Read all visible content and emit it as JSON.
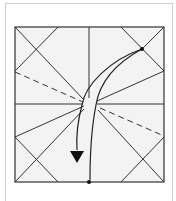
{
  "diagram": {
    "type": "origami-crease-pattern-step",
    "colors": {
      "paper": "#f3f3f3",
      "line": "#333333",
      "frame_border": "#cfcfcf",
      "background": "#ffffff"
    },
    "elements": {
      "square": {
        "x1": 15,
        "y1": 27,
        "x2": 164,
        "y2": 182
      },
      "center": {
        "x": 89,
        "y": 104
      },
      "marked_points": [
        {
          "name": "upper-right-point",
          "x": 142,
          "y": 49
        },
        {
          "name": "bottom-center-point",
          "x": 89,
          "y": 182
        }
      ],
      "dashed_lines": 2,
      "arrow": {
        "from": "upper-right-point",
        "to": "bottom-left-toward-center",
        "head": "filled-triangle"
      }
    }
  }
}
